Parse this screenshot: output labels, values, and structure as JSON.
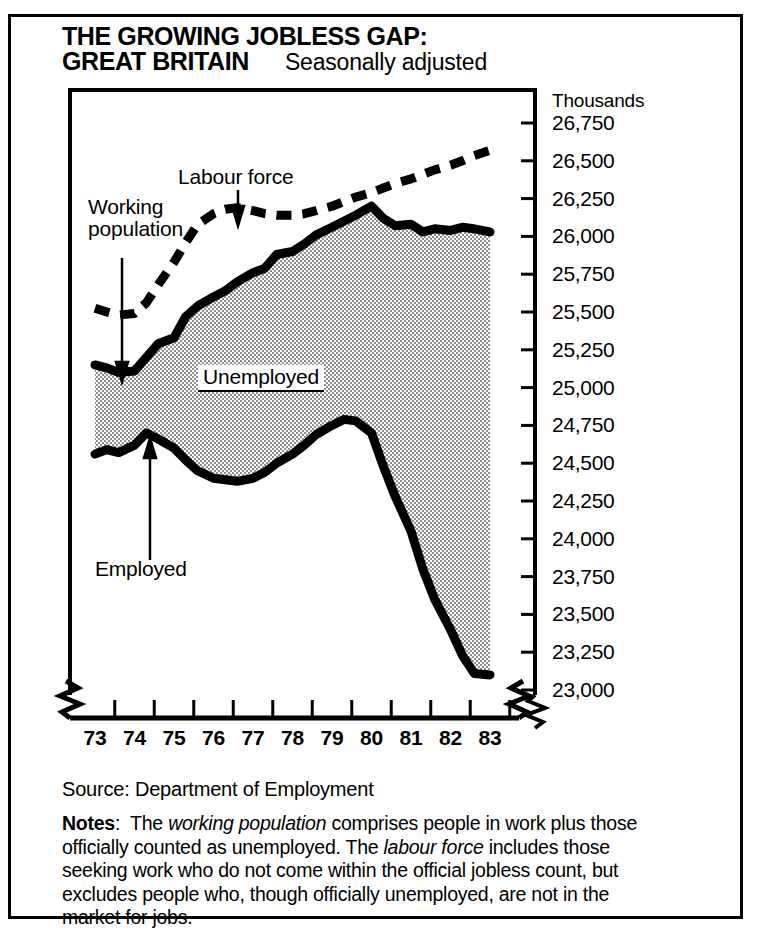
{
  "title": {
    "line1": "THE GROWING JOBLESS GAP:",
    "line2": "GREAT BRITAIN",
    "subtitle": "Seasonally adjusted"
  },
  "units_caption": "Thousands",
  "annotations": {
    "labour_force": "Labour force",
    "working_population_l1": "Working",
    "working_population_l2": "population",
    "unemployed": "Unemployed",
    "employed": "Employed"
  },
  "source": "Source: Department of Employment",
  "notes": {
    "label": "Notes",
    "colon": ":",
    "seg1": "The ",
    "em1": "working population",
    "seg2": " comprises people in work plus those officially counted as unemployed. The ",
    "em2": "labour force",
    "seg3": " includes those seeking work who do not come within the official jobless count, but excludes people who, though officially unemployed, are not in the market for jobs."
  },
  "colors": {
    "ink": "#000000",
    "paper": "#ffffff",
    "shading": "#c8c8c8"
  },
  "chart_data": {
    "type": "area",
    "title": "THE GROWING JOBLESS GAP: GREAT BRITAIN",
    "subtitle": "Seasonally adjusted",
    "xlabel": "",
    "ylabel": "Thousands",
    "xlim": [
      1973,
      1983
    ],
    "ylim": [
      23000,
      26750
    ],
    "y_axis_break": true,
    "x_axis_break": true,
    "grid": false,
    "legend": "inline annotations",
    "yticks": [
      26750,
      26500,
      26250,
      26000,
      25750,
      25500,
      25250,
      25000,
      24750,
      24500,
      24250,
      24000,
      23750,
      23500,
      23250,
      23000
    ],
    "ytick_labels": [
      "26,750",
      "26,500",
      "26,250",
      "26,000",
      "25,750",
      "25,500",
      "25,250",
      "25,000",
      "24,750",
      "24,500",
      "24,250",
      "24,000",
      "23,750",
      "23,500",
      "23,250",
      "23,000"
    ],
    "xticks": [
      1973,
      1974,
      1975,
      1976,
      1977,
      1978,
      1979,
      1980,
      1981,
      1982,
      1983
    ],
    "xtick_labels": [
      "73",
      "74",
      "75",
      "76",
      "77",
      "78",
      "79",
      "80",
      "81",
      "82",
      "83"
    ],
    "shaded_band": {
      "name": "Unemployed",
      "upper_series": "Working population",
      "lower_series": "Employed"
    },
    "series": [
      {
        "name": "Labour force",
        "style": "dashed",
        "x": [
          1973.0,
          1973.3,
          1973.6,
          1974.0,
          1974.3,
          1974.6,
          1975.0,
          1975.3,
          1975.6,
          1976.0,
          1976.3,
          1976.6,
          1977.0,
          1977.3,
          1977.6,
          1978.0,
          1978.3,
          1978.6,
          1979.0,
          1979.3,
          1979.6,
          1980.0,
          1980.3,
          1980.6,
          1981.0,
          1981.3,
          1981.6,
          1982.0,
          1982.3,
          1982.6,
          1983.0
        ],
        "values": [
          25525,
          25500,
          25480,
          25490,
          25560,
          25680,
          25830,
          25960,
          26080,
          26150,
          26180,
          26190,
          26170,
          26150,
          26140,
          26140,
          26150,
          26170,
          26200,
          26230,
          26260,
          26290,
          26320,
          26350,
          26380,
          26410,
          26440,
          26470,
          26500,
          26535,
          26570
        ]
      },
      {
        "name": "Working population",
        "style": "solid-thick",
        "x": [
          1973.0,
          1973.3,
          1973.6,
          1974.0,
          1974.3,
          1974.6,
          1975.0,
          1975.3,
          1975.6,
          1976.0,
          1976.3,
          1976.6,
          1977.0,
          1977.3,
          1977.6,
          1978.0,
          1978.3,
          1978.6,
          1979.0,
          1979.3,
          1979.6,
          1980.0,
          1980.3,
          1980.6,
          1981.0,
          1981.3,
          1981.6,
          1982.0,
          1982.3,
          1982.6,
          1983.0
        ],
        "values": [
          25150,
          25130,
          25100,
          25110,
          25200,
          25290,
          25330,
          25470,
          25540,
          25600,
          25640,
          25700,
          25760,
          25790,
          25880,
          25900,
          25950,
          26010,
          26060,
          26100,
          26140,
          26200,
          26120,
          26070,
          26080,
          26030,
          26050,
          26040,
          26060,
          26050,
          26030
        ]
      },
      {
        "name": "Employed",
        "style": "solid-thick",
        "x": [
          1973.0,
          1973.3,
          1973.6,
          1974.0,
          1974.3,
          1974.6,
          1975.0,
          1975.3,
          1975.6,
          1976.0,
          1976.3,
          1976.6,
          1977.0,
          1977.3,
          1977.6,
          1978.0,
          1978.3,
          1978.6,
          1979.0,
          1979.3,
          1979.6,
          1980.0,
          1980.3,
          1980.6,
          1981.0,
          1981.3,
          1981.6,
          1982.0,
          1982.3,
          1982.6,
          1983.0
        ],
        "values": [
          24560,
          24590,
          24570,
          24620,
          24700,
          24660,
          24600,
          24520,
          24450,
          24400,
          24390,
          24380,
          24400,
          24440,
          24500,
          24560,
          24620,
          24690,
          24750,
          24790,
          24780,
          24700,
          24480,
          24280,
          24050,
          23800,
          23600,
          23400,
          23230,
          23110,
          23100
        ]
      }
    ]
  }
}
